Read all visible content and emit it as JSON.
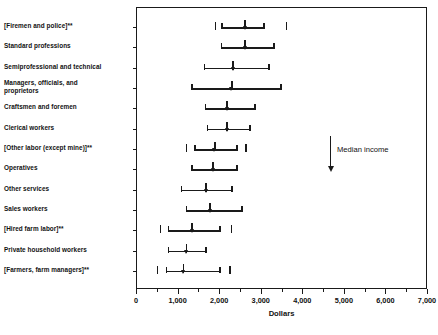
{
  "chart_data": {
    "type": "bar",
    "subtype": "range-with-median",
    "title": "",
    "xlabel": "Dollars",
    "ylabel": "",
    "xlim": [
      0,
      7000
    ],
    "xticks": [
      0,
      1000,
      2000,
      3000,
      4000,
      5000,
      6000,
      7000
    ],
    "xtick_labels": [
      "0",
      "1,000",
      "2,000",
      "3,000",
      "4,000",
      "5,000",
      "6,000",
      "7,000"
    ],
    "minor_tick_step": 500,
    "grid": false,
    "legend": null,
    "annotations": [
      {
        "text": "Median income",
        "marker": "down-arrow",
        "x": 4700,
        "y_category_index": 6
      }
    ],
    "categories": [
      "[Firemen and police]**",
      "Standard professions",
      "Semiprofessional and technical",
      "Managers, officials, and\n    proprietors",
      "Craftsmen and foremen",
      "Clerical workers",
      "[Other labor (except mine)]**",
      "Operatives",
      "Other services",
      "Sales workers",
      "[Hired farm labor]**",
      "Private household workers",
      "[Farmers, farm managers]**"
    ],
    "series": [
      {
        "name": "Income range (low, median, high)",
        "points": [
          {
            "category": "[Firemen and police]**",
            "low": 2050,
            "median": 2600,
            "high": 3060,
            "outer_low": 1890,
            "outer_high": 3600
          },
          {
            "category": "Standard professions",
            "low": 2030,
            "median": 2600,
            "high": 3300,
            "outer_low": null,
            "outer_high": null
          },
          {
            "category": "Semiprofessional and technical",
            "low": 1620,
            "median": 2310,
            "high": 3170,
            "outer_low": null,
            "outer_high": null
          },
          {
            "category": "Managers, officials, and\n    proprietors",
            "low": 1330,
            "median": 2280,
            "high": 3470,
            "outer_low": null,
            "outer_high": null
          },
          {
            "category": "Craftsmen and foremen",
            "low": 1650,
            "median": 2170,
            "high": 2840,
            "outer_low": null,
            "outer_high": null
          },
          {
            "category": "Clerical workers",
            "low": 1700,
            "median": 2170,
            "high": 2720,
            "outer_low": null,
            "outer_high": null
          },
          {
            "category": "[Other labor (except mine)]**",
            "low": 1400,
            "median": 1870,
            "high": 2400,
            "outer_low": 1190,
            "outer_high": 2620
          },
          {
            "category": "Operatives",
            "low": 1330,
            "median": 1830,
            "high": 2400,
            "outer_low": null,
            "outer_high": null
          },
          {
            "category": "Other services",
            "low": 1070,
            "median": 1660,
            "high": 2280,
            "outer_low": null,
            "outer_high": null
          },
          {
            "category": "Sales workers",
            "low": 1190,
            "median": 1760,
            "high": 2520,
            "outer_low": null,
            "outer_high": null
          },
          {
            "category": "[Hired farm labor]**",
            "low": 760,
            "median": 1330,
            "high": 2000,
            "outer_low": 570,
            "outer_high": 2280
          },
          {
            "category": "Private household workers",
            "low": 760,
            "median": 1190,
            "high": 1660,
            "outer_low": null,
            "outer_high": null
          },
          {
            "category": "[Farmers, farm managers]**",
            "low": 710,
            "median": 1120,
            "high": 2000,
            "outer_low": 500,
            "outer_high": 2240
          }
        ]
      }
    ]
  }
}
